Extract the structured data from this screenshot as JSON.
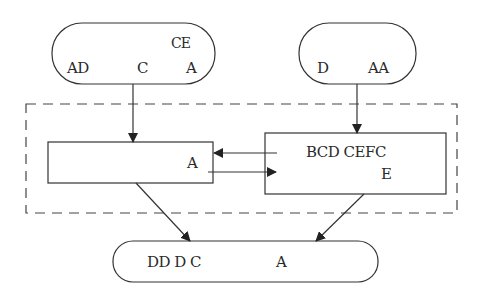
{
  "diagram": {
    "top_left_node": {
      "line1": "CE",
      "line2_a": "AD",
      "line2_b": "C",
      "line2_c": "A"
    },
    "top_right_node": {
      "label_a": "D",
      "label_b": "AA"
    },
    "left_box": {
      "label": "A"
    },
    "right_box": {
      "line1": "BCD CEFC",
      "line2": "E"
    },
    "bottom_node": {
      "label_a": "DD D C",
      "label_b": "A"
    },
    "colors": {
      "stroke": "#333333",
      "text": "#2a2a2a",
      "background": "#ffffff"
    }
  }
}
